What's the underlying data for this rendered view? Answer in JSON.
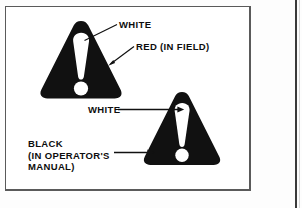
{
  "figure": {
    "caption_labels": {
      "white_top": "WHITE",
      "red_field": "RED (IN FIELD)",
      "white_lower": "WHITE",
      "black_manual_line1": "BLACK",
      "black_manual_line2": "(IN OPERATOR'S",
      "black_manual_line3": "MANUAL)"
    },
    "symbols": [
      {
        "name": "safety-alert-triangle-upper",
        "shape": "rounded-triangle",
        "body_color": "#111111",
        "mark_color": "#ffffff",
        "mark": "exclamation"
      },
      {
        "name": "safety-alert-triangle-lower",
        "shape": "rounded-triangle",
        "body_color": "#111111",
        "mark_color": "#ffffff",
        "mark": "exclamation"
      }
    ],
    "leader_lines": [
      {
        "name": "leader-white-top",
        "style": "diagonal-line",
        "points_to": "exclamation-upper"
      },
      {
        "name": "leader-red-field",
        "style": "diagonal-arrow",
        "points_to": "triangle-upper-edge"
      },
      {
        "name": "leader-white-lower",
        "style": "horizontal-arrow",
        "points_to": "exclamation-lower"
      },
      {
        "name": "leader-black-manual",
        "style": "horizontal-arrow",
        "points_to": "triangle-lower-body"
      }
    ],
    "colors": {
      "ink": "#111111",
      "paper": "#ffffff",
      "frame": "#5a5a5a"
    }
  }
}
